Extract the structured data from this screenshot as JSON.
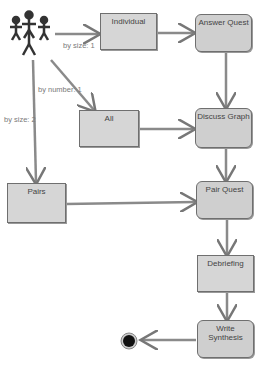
{
  "diagram": {
    "actor": {
      "label": "group-of-people"
    },
    "nodes": [
      {
        "id": "individual",
        "label": "Individual",
        "shape": "rect"
      },
      {
        "id": "answer_quest",
        "label": "Answer Quest",
        "shape": "rounded"
      },
      {
        "id": "all",
        "label": "All",
        "shape": "rect"
      },
      {
        "id": "discuss_graph",
        "label": "Discuss Graph",
        "shape": "rounded"
      },
      {
        "id": "pairs",
        "label": "Pairs",
        "shape": "rect"
      },
      {
        "id": "pair_quest",
        "label": "Pair Quest",
        "shape": "rounded"
      },
      {
        "id": "debriefing",
        "label": "Debriefing",
        "shape": "rect"
      },
      {
        "id": "write_synthesis",
        "label": "Write Synthesis",
        "shape": "rounded"
      }
    ],
    "edge_labels": {
      "by_size_1": "by size: 1",
      "by_number_1": "by number: 1",
      "by_size_2": "by size: 2"
    },
    "end_node": {
      "label": "final-state"
    }
  }
}
